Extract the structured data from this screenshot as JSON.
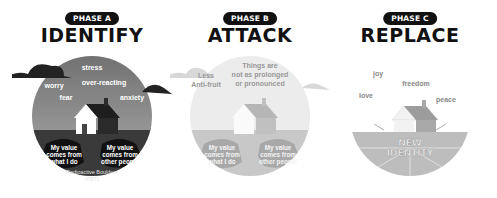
{
  "phases": [
    {
      "badge": "PHASE A",
      "title": "IDENTIFY",
      "sky_words": [
        "stress",
        "worry",
        "over-reacting",
        "fear",
        "anxiety"
      ],
      "boulders": [
        {
          "line1": "My value",
          "line2": "comes from",
          "line3": "what I do"
        },
        {
          "line1": "My value",
          "line2": "comes from",
          "line3": "other people"
        }
      ],
      "caption_line1": "Radioactive Boulders",
      "caption_line2": "(PBT)"
    },
    {
      "badge": "PHASE B",
      "title": "ATTACK",
      "sky_words": [
        "Less",
        "Anti-fruit",
        "Things are",
        "not as prolonged",
        "or pronounced"
      ],
      "boulders": [
        {
          "line1": "My value",
          "line2": "comes from",
          "line3": "what I do"
        },
        {
          "line1": "My value",
          "line2": "comes from",
          "line3": "other people"
        }
      ]
    },
    {
      "badge": "PHASE C",
      "title": "REPLACE",
      "sky_words": [
        "joy",
        "freedom",
        "love",
        "peace"
      ],
      "center_line1": "NEW",
      "center_line2": "IDENTITY"
    }
  ],
  "colors": {
    "dark": "#111111",
    "phase_a_sky": "#9a9a9a",
    "phase_a_ground": "#3a3a3a",
    "phase_b_sky": "#ececec",
    "phase_b_ground": "#c8c8c8",
    "phase_c_sky": "#ffffff",
    "phase_c_ground": "#bdbdbd"
  }
}
